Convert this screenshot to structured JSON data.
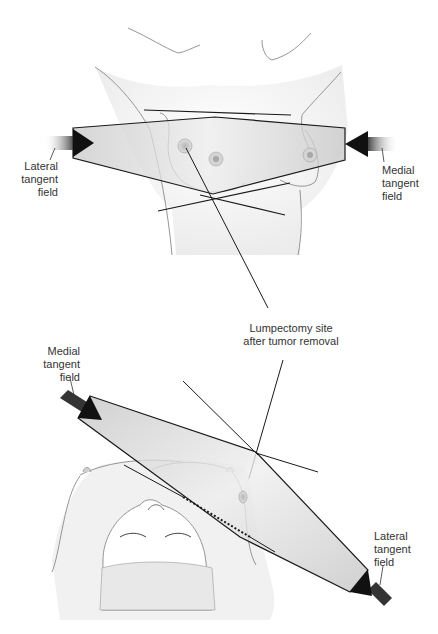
{
  "figure": {
    "top_view": {
      "lateral_label": [
        "Lateral",
        "tangent",
        "field"
      ],
      "medial_label": [
        "Medial",
        "tangent",
        "field"
      ]
    },
    "callout": {
      "lines": [
        "Lumpectomy site",
        "after tumor removal"
      ]
    },
    "bottom_view": {
      "medial_label": [
        "Medial",
        "tangent",
        "field"
      ],
      "lateral_label": [
        "Lateral",
        "tangent",
        "field"
      ]
    },
    "colors": {
      "beam_fill": "#d6d6d6",
      "outline": "#1a1a1a",
      "skin_line": "#8a8a8a",
      "text": "#333333"
    }
  }
}
